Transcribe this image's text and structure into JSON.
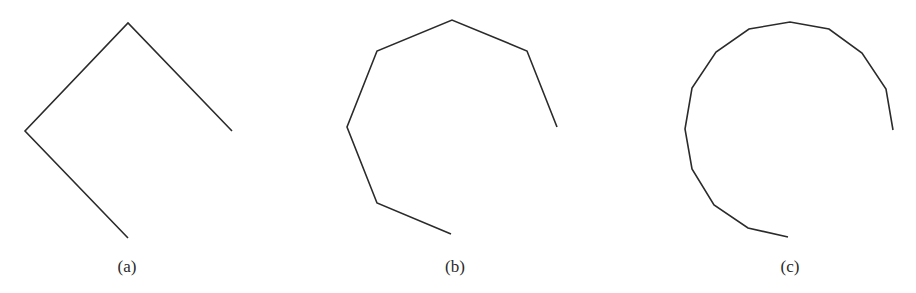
{
  "figure": {
    "stroke_color": "#2b2b2b",
    "stroke_width": 1.6,
    "panels": [
      {
        "id": "a",
        "caption": "(a)",
        "caption_pos": [
          127,
          258
        ],
        "vertex_count": 4,
        "points": [
          [
            128,
            238
          ],
          [
            25,
            131
          ],
          [
            128,
            23
          ],
          [
            232,
            131
          ]
        ]
      },
      {
        "id": "b",
        "caption": "(b)",
        "caption_pos": [
          455,
          258
        ],
        "vertex_count": 7,
        "points": [
          [
            451,
            234
          ],
          [
            377,
            203
          ],
          [
            347,
            127
          ],
          [
            377,
            51
          ],
          [
            452,
            20
          ],
          [
            527,
            51
          ],
          [
            557,
            127
          ]
        ]
      },
      {
        "id": "c",
        "caption": "(c)",
        "caption_pos": [
          790,
          258
        ],
        "vertex_count": 13,
        "points": [
          [
            788,
            237
          ],
          [
            748,
            228
          ],
          [
            714,
            205
          ],
          [
            692,
            169
          ],
          [
            685,
            129
          ],
          [
            692,
            88
          ],
          [
            716,
            52
          ],
          [
            749,
            29
          ],
          [
            790,
            22
          ],
          [
            829,
            29
          ],
          [
            862,
            53
          ],
          [
            886,
            89
          ],
          [
            893,
            130
          ]
        ]
      }
    ]
  }
}
